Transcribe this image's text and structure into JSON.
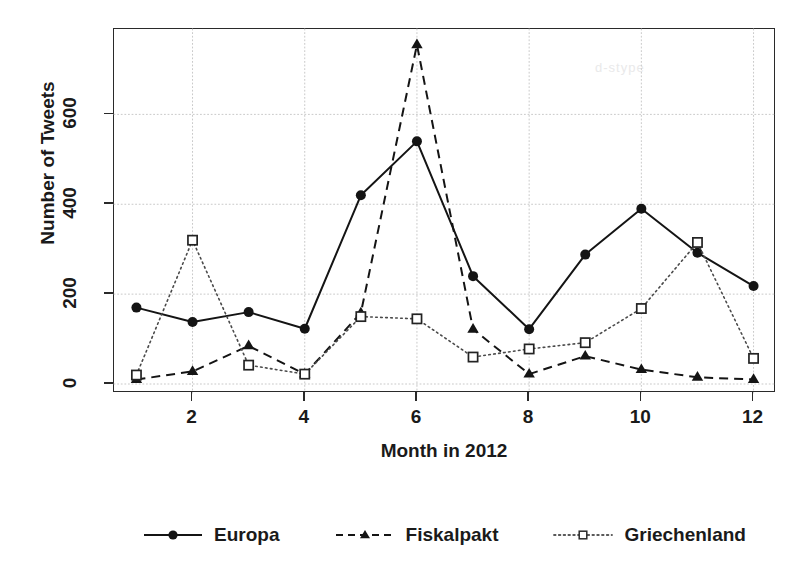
{
  "chart_data": {
    "type": "line",
    "title": "",
    "xlabel": "Month in 2012",
    "ylabel": "Number of Tweets",
    "x": [
      1,
      2,
      3,
      4,
      5,
      6,
      7,
      8,
      9,
      10,
      11,
      12
    ],
    "xlim": [
      0.6,
      12.4
    ],
    "ylim": [
      -20,
      790
    ],
    "xticks": [
      2,
      4,
      6,
      8,
      10,
      12
    ],
    "xtick_labels": [
      "2",
      "4",
      "6",
      "8",
      "10",
      "12"
    ],
    "yticks": [
      0,
      200,
      400,
      600
    ],
    "ytick_labels": [
      "0",
      "200",
      "400",
      "600"
    ],
    "grid": true,
    "grid_style": "dotted",
    "legend_position": "bottom",
    "series": [
      {
        "name": "Europa",
        "line_style": "solid",
        "marker": "filled-circle",
        "color": "#141414",
        "values": [
          170,
          138,
          160,
          123,
          420,
          540,
          240,
          122,
          288,
          390,
          292,
          218
        ]
      },
      {
        "name": "Fiskalpakt",
        "line_style": "dashed",
        "marker": "filled-triangle",
        "color": "#141414",
        "values": [
          10,
          28,
          85,
          22,
          158,
          755,
          122,
          22,
          62,
          32,
          15,
          10
        ]
      },
      {
        "name": "Griechenland",
        "line_style": "dotted",
        "marker": "open-square",
        "color": "#4a4a4a",
        "values": [
          20,
          320,
          42,
          22,
          150,
          145,
          60,
          78,
          92,
          168,
          315,
          57
        ]
      }
    ]
  },
  "axes": {
    "y_label": "Number of Tweets",
    "x_label": "Month in 2012",
    "y_tick_labels": [
      "0",
      "200",
      "400",
      "600"
    ],
    "x_tick_labels": [
      "2",
      "4",
      "6",
      "8",
      "10",
      "12"
    ]
  },
  "legend": {
    "items": [
      {
        "label": "Europa"
      },
      {
        "label": "Fiskalpakt"
      },
      {
        "label": "Griechenland"
      }
    ]
  },
  "artifacts": {
    "bleed_1": "d-stype",
    "bleed_2": "",
    "bleed_3": ""
  }
}
